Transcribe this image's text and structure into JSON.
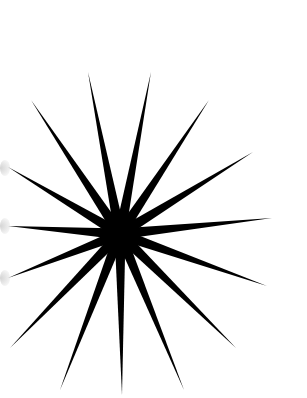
{
  "image": {
    "description": "Black starburst with thin tapered spikes radiating from a solid dark center on a white background",
    "background_color": "#ffffff",
    "ink_color": "#000000",
    "center": [
      120,
      234
    ],
    "core_radius": 14,
    "ray_tips": [
      [
        88,
        72
      ],
      [
        151,
        72
      ],
      [
        31,
        100
      ],
      [
        209,
        100
      ],
      [
        8,
        167
      ],
      [
        253,
        152
      ],
      [
        8,
        226
      ],
      [
        272,
        218
      ],
      [
        8,
        278
      ],
      [
        267,
        286
      ],
      [
        10,
        348
      ],
      [
        236,
        348
      ],
      [
        60,
        390
      ],
      [
        122,
        395
      ],
      [
        184,
        390
      ]
    ]
  }
}
